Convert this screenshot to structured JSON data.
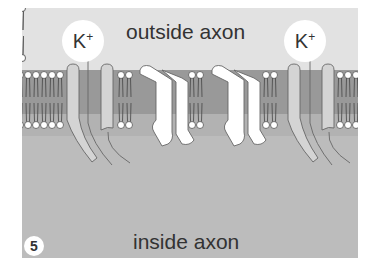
{
  "figure": {
    "step_number": "5",
    "outside_label": "outside axon",
    "inside_label": "inside axon",
    "ions": [
      {
        "symbol": "K",
        "charge": "+",
        "position": "left channel"
      },
      {
        "symbol": "K",
        "charge": "+",
        "position": "right channel"
      }
    ]
  },
  "colors": {
    "outside": "#e2e2e2",
    "inside": "#bcbcbc",
    "membrane_core": "#999999",
    "membrane_lower": "#b0b0b0",
    "protein": "#ffffff",
    "channel": "#d4d4d4"
  }
}
